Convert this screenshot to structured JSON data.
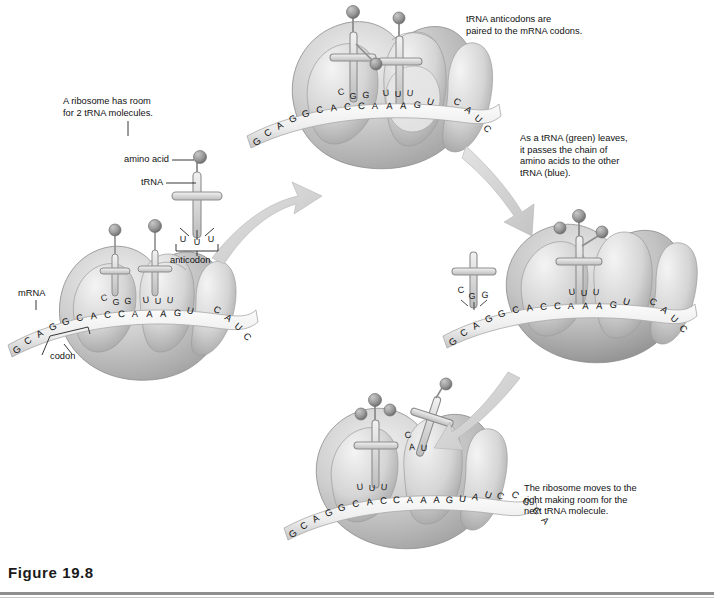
{
  "figure": {
    "caption_number": "Figure 19.8",
    "domain_title": "Translation: a ribosome moving along mRNA with two tRNA molecules"
  },
  "notes": [
    {
      "id": "note-ribosome-room",
      "text": "A ribosome has room\nfor 2 tRNA molecules.",
      "x": 63,
      "y": 96
    },
    {
      "id": "note-anticodons-paired",
      "text": "tRNA anticodons are\npaired to the mRNA codons.",
      "x": 466,
      "y": 14
    },
    {
      "id": "note-trna-leaves",
      "text": "As a tRNA (green) leaves,\nit passes the chain of\namino acids to the other\ntRNA (blue).",
      "x": 520,
      "y": 133
    },
    {
      "id": "note-ribosome-moves",
      "text": "The ribosome moves to the\nright making room for the\nnext tRNA molecule.",
      "x": 524,
      "y": 483
    }
  ],
  "callouts": {
    "amino_acid": "amino acid",
    "trna": "tRNA",
    "anticodon": "anticodon",
    "mrna": "mRNA",
    "codon": "codon"
  },
  "stages": [
    {
      "id": "stage-1-initial",
      "name": "Lower-left ribosome: two tRNAs bound",
      "mrna_sequence": "GCAGGCACCAAAGUCAUC",
      "trna_anticodons": [
        "CGG",
        "UUU"
      ],
      "free_trna_anticodon": "UUU"
    },
    {
      "id": "stage-2-paired",
      "name": "Top ribosome: anticodons paired to codons",
      "mrna_sequence": "GCAGGCACCAAAGUCAUC",
      "trna_anticodons": [
        "CGG",
        "UUU"
      ]
    },
    {
      "id": "stage-3-leaving",
      "name": "Right ribosome: green tRNA leaves",
      "mrna_sequence": "GCAGGCACCAAAGUCAUC",
      "trna_anticodons": [
        "UUU"
      ],
      "departing_trna_anticodon": "CGG"
    },
    {
      "id": "stage-4-moved",
      "name": "Bottom ribosome: moved right, next tRNA arriving",
      "mrna_sequence": "GCAGGCACCAAAGUAUCCGCA",
      "trna_anticodons": [
        "UUU"
      ],
      "incoming_trna_anticodon": "CAU"
    }
  ],
  "colors": {
    "background": "#ffffff",
    "ribosome_fill": "#c9c9c9",
    "ribosome_shade": "#9d9d9d",
    "ribosome_light": "#e2e2e2",
    "trna_fill": "#d8d8d8",
    "amino_acid_fill": "#8d8d8d",
    "arrow_fill": "#d2d2d2",
    "text": "#111111",
    "rule": "#8e8e8e"
  }
}
